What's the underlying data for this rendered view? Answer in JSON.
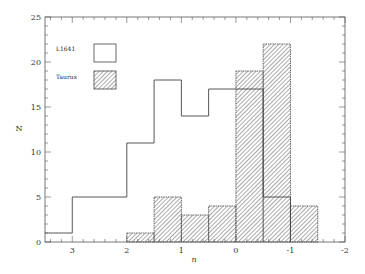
{
  "chart_data": {
    "type": "bar",
    "subtype": "histogram-step",
    "title": "",
    "xlabel": "n",
    "ylabel": "N",
    "xlim": [
      3.5,
      -2
    ],
    "ylim": [
      0,
      25
    ],
    "x_ticks": [
      "3",
      "2",
      "1",
      "0",
      "-1",
      "-2"
    ],
    "y_ticks": [
      "0",
      "5",
      "10",
      "15",
      "20",
      "25"
    ],
    "grid": false,
    "legend_position": "upper-left",
    "bin_width": 0.5,
    "series": [
      {
        "name": "L1641",
        "style": "open",
        "bins": [
          {
            "from": 3.5,
            "to": 3.0,
            "value": 1
          },
          {
            "from": 3.0,
            "to": 2.0,
            "value": 5
          },
          {
            "from": 2.0,
            "to": 1.5,
            "value": 11
          },
          {
            "from": 1.5,
            "to": 1.0,
            "value": 18
          },
          {
            "from": 1.0,
            "to": 0.5,
            "value": 14
          },
          {
            "from": 0.5,
            "to": -0.5,
            "value": 17
          },
          {
            "from": -0.5,
            "to": -1.0,
            "value": 5
          }
        ]
      },
      {
        "name": "Taurus",
        "style": "hatched",
        "bins": [
          {
            "from": 2.0,
            "to": 1.5,
            "value": 1
          },
          {
            "from": 1.5,
            "to": 1.0,
            "value": 5
          },
          {
            "from": 1.0,
            "to": 0.5,
            "value": 3
          },
          {
            "from": 0.5,
            "to": 0.0,
            "value": 4
          },
          {
            "from": 0.0,
            "to": -0.5,
            "value": 19
          },
          {
            "from": -0.5,
            "to": -1.0,
            "value": 22
          },
          {
            "from": -1.0,
            "to": -1.5,
            "value": 4
          }
        ]
      }
    ]
  },
  "legend": {
    "items": [
      {
        "label": "L1641"
      },
      {
        "label": "Taurus"
      }
    ]
  },
  "colors": {
    "line": "#444444",
    "hatch": "#555555",
    "background": "#ffffff"
  }
}
